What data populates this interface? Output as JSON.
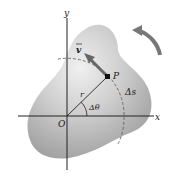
{
  "diagram": {
    "labels": {
      "y_axis": "y",
      "x_axis": "x",
      "origin": "O",
      "point": "P",
      "velocity": "v",
      "radius": "r",
      "angle": "Δθ",
      "arc_length": "Δs"
    },
    "colors": {
      "body_fill": "#b8b8b8",
      "body_light": "#e6e6e6",
      "axis": "#222222",
      "arrow": "#666666",
      "dashed": "#555555"
    }
  }
}
